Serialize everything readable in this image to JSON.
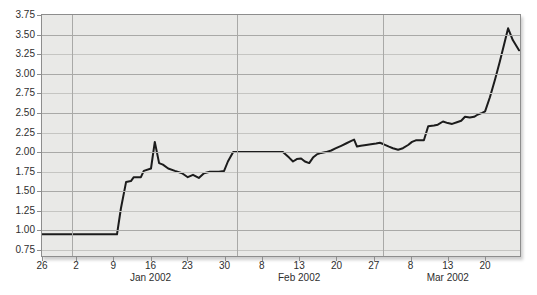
{
  "chart_data": {
    "type": "line",
    "title": "",
    "xlabel": "",
    "ylabel": "",
    "grid": true,
    "legend": "none",
    "y_axis": {
      "tick_values": [
        3.75,
        3.5,
        3.25,
        3.0,
        2.75,
        2.5,
        2.25,
        2.0,
        1.75,
        1.5,
        1.25,
        1.0,
        0.75
      ],
      "tick_labels": [
        "3.75",
        "3.50",
        "3.25",
        "3.00",
        "2.75",
        "2.50",
        "2.25",
        "2.00",
        "1.75",
        "1.50",
        "1.25",
        "1.00",
        "0.75"
      ],
      "range_top": 3.75,
      "range_bottom_displayed": 0.673
    },
    "x_axis": {
      "ticks": [
        {
          "label": "26",
          "frac": 0.0
        },
        {
          "label": "2",
          "frac": 0.071
        },
        {
          "label": "9",
          "frac": 0.149
        },
        {
          "label": "16",
          "frac": 0.227
        },
        {
          "label": "23",
          "frac": 0.304
        },
        {
          "label": "30",
          "frac": 0.382
        },
        {
          "label": "8",
          "frac": 0.46
        },
        {
          "label": "13",
          "frac": 0.538
        },
        {
          "label": "20",
          "frac": 0.616
        },
        {
          "label": "27",
          "frac": 0.694
        },
        {
          "label": "8",
          "frac": 0.771
        },
        {
          "label": "13",
          "frac": 0.849
        },
        {
          "label": "20",
          "frac": 0.927
        }
      ],
      "month_labels": [
        {
          "label": "Jan 2002",
          "frac": 0.227
        },
        {
          "label": "Feb 2002",
          "frac": 0.538
        },
        {
          "label": "Mar 2002",
          "frac": 0.849
        }
      ],
      "month_boundary_fracs": [
        0.063,
        0.408,
        0.713
      ]
    },
    "series": [
      {
        "name": "price-line",
        "points": [
          [
            0.0,
            0.95
          ],
          [
            0.157,
            0.95
          ],
          [
            0.165,
            1.28
          ],
          [
            0.176,
            1.62
          ],
          [
            0.186,
            1.63
          ],
          [
            0.192,
            1.68
          ],
          [
            0.207,
            1.68
          ],
          [
            0.213,
            1.76
          ],
          [
            0.228,
            1.79
          ],
          [
            0.236,
            2.13
          ],
          [
            0.245,
            1.86
          ],
          [
            0.253,
            1.84
          ],
          [
            0.264,
            1.79
          ],
          [
            0.278,
            1.76
          ],
          [
            0.293,
            1.73
          ],
          [
            0.305,
            1.68
          ],
          [
            0.316,
            1.71
          ],
          [
            0.328,
            1.67
          ],
          [
            0.339,
            1.73
          ],
          [
            0.351,
            1.75
          ],
          [
            0.37,
            1.75
          ],
          [
            0.381,
            1.76
          ],
          [
            0.389,
            1.88
          ],
          [
            0.4,
            2.0
          ],
          [
            0.504,
            2.0
          ],
          [
            0.517,
            1.93
          ],
          [
            0.525,
            1.88
          ],
          [
            0.533,
            1.91
          ],
          [
            0.542,
            1.92
          ],
          [
            0.55,
            1.88
          ],
          [
            0.559,
            1.86
          ],
          [
            0.567,
            1.93
          ],
          [
            0.575,
            1.97
          ],
          [
            0.584,
            1.99
          ],
          [
            0.594,
            2.0
          ],
          [
            0.605,
            2.02
          ],
          [
            0.615,
            2.05
          ],
          [
            0.626,
            2.08
          ],
          [
            0.636,
            2.11
          ],
          [
            0.646,
            2.14
          ],
          [
            0.653,
            2.16
          ],
          [
            0.659,
            2.07
          ],
          [
            0.667,
            2.08
          ],
          [
            0.678,
            2.09
          ],
          [
            0.688,
            2.1
          ],
          [
            0.699,
            2.11
          ],
          [
            0.707,
            2.12
          ],
          [
            0.715,
            2.1
          ],
          [
            0.726,
            2.07
          ],
          [
            0.734,
            2.05
          ],
          [
            0.745,
            2.03
          ],
          [
            0.755,
            2.05
          ],
          [
            0.766,
            2.09
          ],
          [
            0.774,
            2.13
          ],
          [
            0.782,
            2.15
          ],
          [
            0.799,
            2.15
          ],
          [
            0.808,
            2.33
          ],
          [
            0.82,
            2.34
          ],
          [
            0.828,
            2.35
          ],
          [
            0.839,
            2.39
          ],
          [
            0.849,
            2.37
          ],
          [
            0.858,
            2.36
          ],
          [
            0.868,
            2.38
          ],
          [
            0.877,
            2.4
          ],
          [
            0.885,
            2.45
          ],
          [
            0.895,
            2.44
          ],
          [
            0.904,
            2.45
          ],
          [
            0.912,
            2.48
          ],
          [
            0.921,
            2.5
          ],
          [
            0.927,
            2.52
          ],
          [
            0.937,
            2.7
          ],
          [
            0.948,
            2.93
          ],
          [
            0.958,
            3.16
          ],
          [
            0.967,
            3.38
          ],
          [
            0.975,
            3.58
          ],
          [
            0.985,
            3.43
          ],
          [
            0.998,
            3.3
          ]
        ]
      }
    ],
    "colors": {
      "line": "#1c1c1c",
      "plot_bg": "#e9e9e7",
      "grid_major": "#a9a9a7",
      "grid_minor": "#c5c5c2",
      "frame": "#8d8d8d",
      "tick": "#8d8d8d",
      "text": "#2e2e2e"
    }
  }
}
